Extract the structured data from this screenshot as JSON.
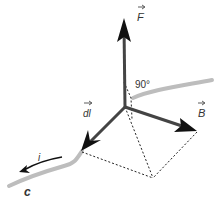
{
  "diagram": {
    "labels": {
      "force": "F",
      "length_element": "dl",
      "field": "B",
      "angle": "90°",
      "current": "i",
      "curve": "c"
    },
    "colors": {
      "vector": "#222222",
      "wire": "#bdbdbd",
      "dotted": "#222222",
      "text": "#333333"
    },
    "points": {
      "origin": [
        125,
        107
      ],
      "F_tip": [
        124,
        20
      ],
      "dl_tip": [
        82,
        150
      ],
      "B_tip": [
        197,
        132
      ],
      "parallelogram_corner": [
        153,
        178
      ]
    }
  }
}
